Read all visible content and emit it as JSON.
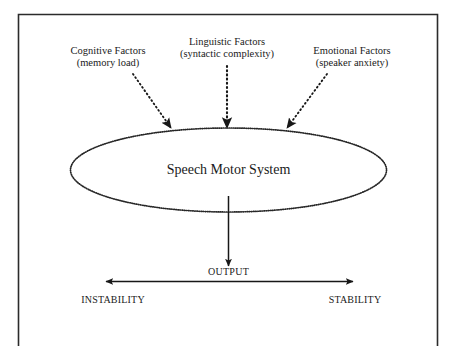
{
  "figure": {
    "frame": {
      "name": "figure-border",
      "color": "#2b2b2b"
    },
    "background_color": "#ffffff",
    "ink_color": "#1a1a1a",
    "inputs": [
      {
        "id": "cognitive",
        "line1": "Cognitive Factors",
        "line2": "(memory load)",
        "arrow_style": "dotted",
        "arrow_direction": "down-right"
      },
      {
        "id": "linguistic",
        "line1": "Linguistic Factors",
        "line2": "(syntactic complexity)",
        "arrow_style": "dotted",
        "arrow_direction": "down"
      },
      {
        "id": "emotional",
        "line1": "Emotional Factors",
        "line2": "(speaker anxiety)",
        "arrow_style": "dotted",
        "arrow_direction": "down-left"
      }
    ],
    "system": {
      "label": "Speech Motor System",
      "shape": "ellipse",
      "stroke_style": "dotted"
    },
    "output": {
      "label": "OUTPUT",
      "arrow_style": "solid",
      "arrow_direction": "down"
    },
    "continuum": {
      "left_label": "INSTABILITY",
      "right_label": "STABILITY",
      "arrow_style": "solid",
      "arrow_direction": "double"
    }
  }
}
